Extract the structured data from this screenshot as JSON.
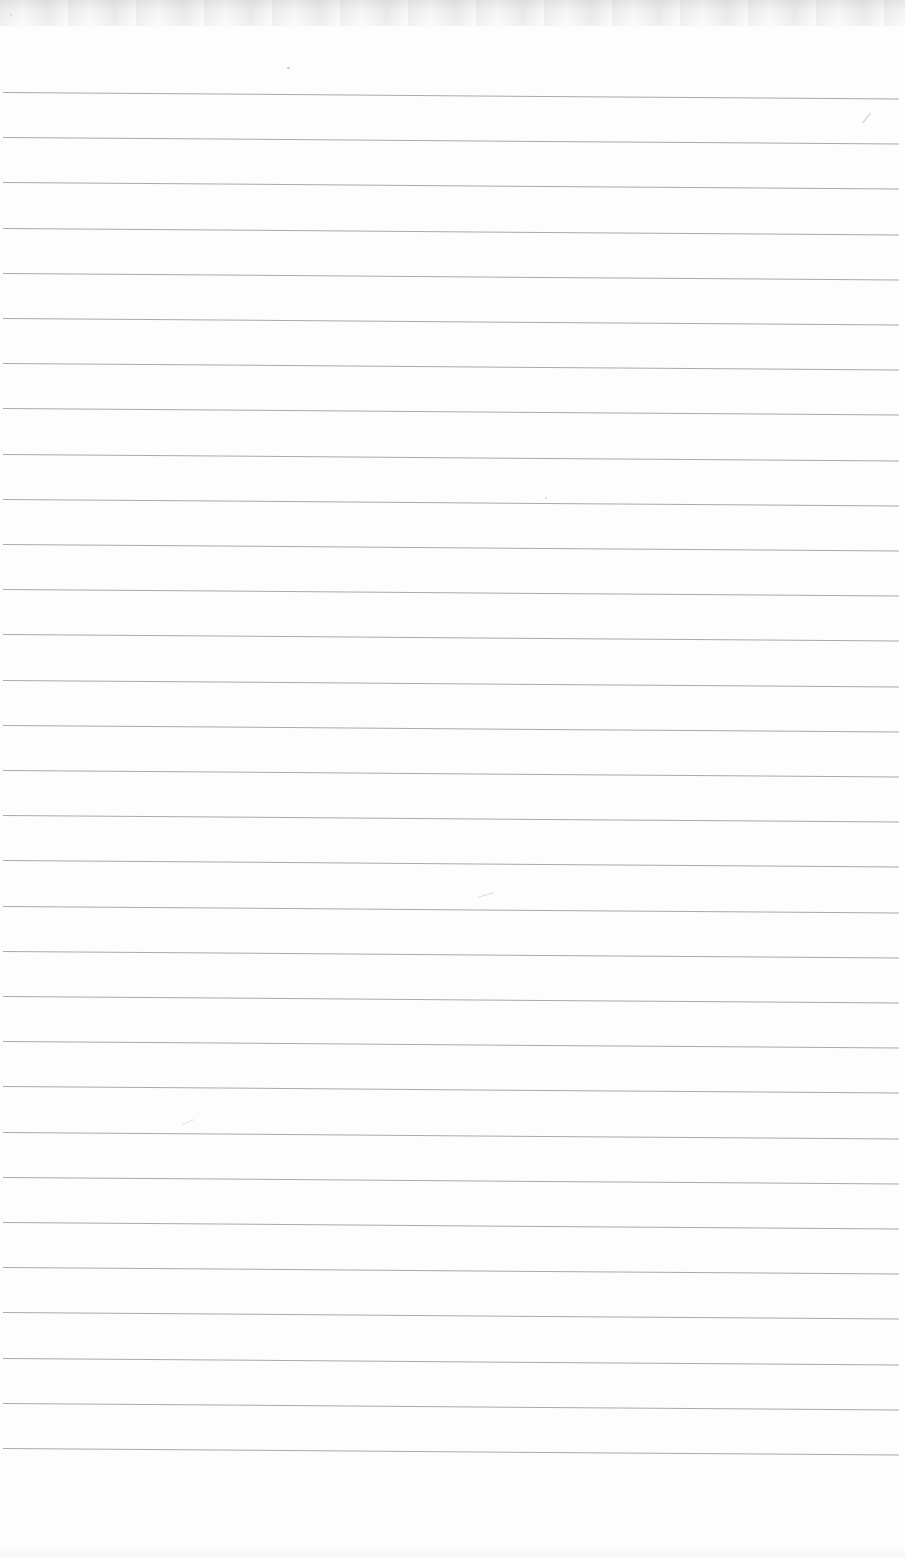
{
  "page": {
    "background_color": "#fdfdfd",
    "top_edge_color": "#e7e7e7",
    "ruling": {
      "line_count": 31,
      "first_line_y": 92,
      "line_spacing": 45.2,
      "line_left": 3,
      "line_length": 896,
      "line_thickness": 1,
      "line_color": "#8e8e8e",
      "line_opacity": 0.75,
      "skew_deg": 0.42
    },
    "marks": [
      {
        "name": "speck-top-center-left",
        "x": 287,
        "y": 67,
        "w": 3,
        "h": 2,
        "rot": 0,
        "color": "#b2b2b2",
        "opacity": 0.7
      },
      {
        "name": "slash-top-right",
        "x": 863,
        "y": 122,
        "w": 12,
        "h": 1,
        "rot": -52,
        "color": "#b6b6b6",
        "opacity": 0.8
      },
      {
        "name": "speck-middle",
        "x": 545,
        "y": 497,
        "w": 2,
        "h": 2,
        "rot": 0,
        "color": "#cfcfcf",
        "opacity": 0.7
      },
      {
        "name": "smudge-center",
        "x": 477,
        "y": 897,
        "w": 17,
        "h": 1,
        "rot": -16,
        "color": "#cccccc",
        "opacity": 0.7
      },
      {
        "name": "smudge-left",
        "x": 182,
        "y": 1124,
        "w": 13,
        "h": 1,
        "rot": -22,
        "color": "#d8d8d8",
        "opacity": 0.7
      },
      {
        "name": "speck-top-left",
        "x": 10,
        "y": 14,
        "w": 2,
        "h": 2,
        "rot": 0,
        "color": "#c4c4c4",
        "opacity": 0.6
      }
    ]
  }
}
